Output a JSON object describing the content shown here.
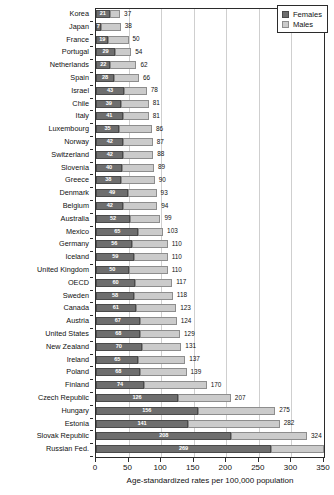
{
  "chart_data": {
    "type": "bar",
    "orientation": "horizontal",
    "stacked": true,
    "title": "",
    "subtitle": "",
    "xlabel": "Age-standardized rates per 100,000 population",
    "ylabel": "",
    "xlim": [
      0,
      350
    ],
    "xticks": [
      0,
      50,
      100,
      150,
      200,
      250,
      300,
      350
    ],
    "grid": "vertical",
    "legend_position": "top-right",
    "legend": [
      "Females",
      "Males"
    ],
    "series": [
      {
        "name": "Females",
        "color": "#6e6e6e"
      },
      {
        "name": "Males",
        "color": "#cbcbcb"
      }
    ],
    "categories": [
      "Korea",
      "Japan",
      "France",
      "Portugal",
      "Netherlands",
      "Spain",
      "Israel",
      "Chile",
      "Italy",
      "Luxembourg",
      "Norway",
      "Switzerland",
      "Slovenia",
      "Greece",
      "Denmark",
      "Belgium",
      "Australia",
      "Mexico",
      "Germany",
      "Iceland",
      "United Kingdom",
      "OECD",
      "Sweden",
      "Canada",
      "Austria",
      "United States",
      "New Zealand",
      "Ireland",
      "Poland",
      "Finland",
      "Czech Republic",
      "Hungary",
      "Estonia",
      "Slovak Republic",
      "Russian Fed."
    ],
    "rows": [
      {
        "category": "Korea",
        "females": 21,
        "total": 37,
        "total_label": "37"
      },
      {
        "category": "Japan",
        "females": 7,
        "total": 38,
        "total_label": "38"
      },
      {
        "category": "France",
        "females": 19,
        "total": 50,
        "total_label": "50"
      },
      {
        "category": "Portugal",
        "females": 29,
        "total": 54,
        "total_label": "54"
      },
      {
        "category": "Netherlands",
        "females": 22,
        "total": 62,
        "total_label": "62"
      },
      {
        "category": "Spain",
        "females": 28,
        "total": 66,
        "total_label": "66"
      },
      {
        "category": "Israel",
        "females": 43,
        "total": 78,
        "total_label": "78"
      },
      {
        "category": "Chile",
        "females": 39,
        "total": 81,
        "total_label": "81"
      },
      {
        "category": "Italy",
        "females": 41,
        "total": 81,
        "total_label": "81"
      },
      {
        "category": "Luxembourg",
        "females": 35,
        "total": 86,
        "total_label": "86"
      },
      {
        "category": "Norway",
        "females": 42,
        "total": 87,
        "total_label": "87"
      },
      {
        "category": "Switzerland",
        "females": 42,
        "total": 88,
        "total_label": "88"
      },
      {
        "category": "Slovenia",
        "females": 40,
        "total": 89,
        "total_label": "89"
      },
      {
        "category": "Greece",
        "females": 38,
        "total": 90,
        "total_label": "90"
      },
      {
        "category": "Denmark",
        "females": 49,
        "total": 93,
        "total_label": "93"
      },
      {
        "category": "Belgium",
        "females": 42,
        "total": 94,
        "total_label": "94"
      },
      {
        "category": "Australia",
        "females": 52,
        "total": 99,
        "total_label": "99"
      },
      {
        "category": "Mexico",
        "females": 65,
        "total": 103,
        "total_label": "103"
      },
      {
        "category": "Germany",
        "females": 56,
        "total": 110,
        "total_label": "110"
      },
      {
        "category": "Iceland",
        "females": 59,
        "total": 110,
        "total_label": "110"
      },
      {
        "category": "United Kingdom",
        "females": 50,
        "total": 110,
        "total_label": "110"
      },
      {
        "category": "OECD",
        "females": 60,
        "total": 117,
        "total_label": "117"
      },
      {
        "category": "Sweden",
        "females": 58,
        "total": 118,
        "total_label": "118"
      },
      {
        "category": "Canada",
        "females": 61,
        "total": 123,
        "total_label": "123"
      },
      {
        "category": "Austria",
        "females": 67,
        "total": 124,
        "total_label": "124"
      },
      {
        "category": "United States",
        "females": 68,
        "total": 129,
        "total_label": "129"
      },
      {
        "category": "New Zealand",
        "females": 70,
        "total": 131,
        "total_label": "131"
      },
      {
        "category": "Ireland",
        "females": 65,
        "total": 137,
        "total_label": "137"
      },
      {
        "category": "Poland",
        "females": 68,
        "total": 139,
        "total_label": "139"
      },
      {
        "category": "Finland",
        "females": 74,
        "total": 170,
        "total_label": "170"
      },
      {
        "category": "Czech Republic",
        "females": 126,
        "total": 207,
        "total_label": "207"
      },
      {
        "category": "Hungary",
        "females": 156,
        "total": 275,
        "total_label": "275"
      },
      {
        "category": "Estonia",
        "females": 141,
        "total": 282,
        "total_label": "282"
      },
      {
        "category": "Slovak Republic",
        "females": 208,
        "total": 324,
        "total_label": "324"
      },
      {
        "category": "Russian Fed.",
        "females": 269,
        "total": 350,
        "total_label": ""
      }
    ]
  },
  "colors": {
    "females": "#6e6e6e",
    "males": "#cbcbcb",
    "axis": "#2b2b2b",
    "grid": "#cfcfcf",
    "background": "#ffffff"
  }
}
